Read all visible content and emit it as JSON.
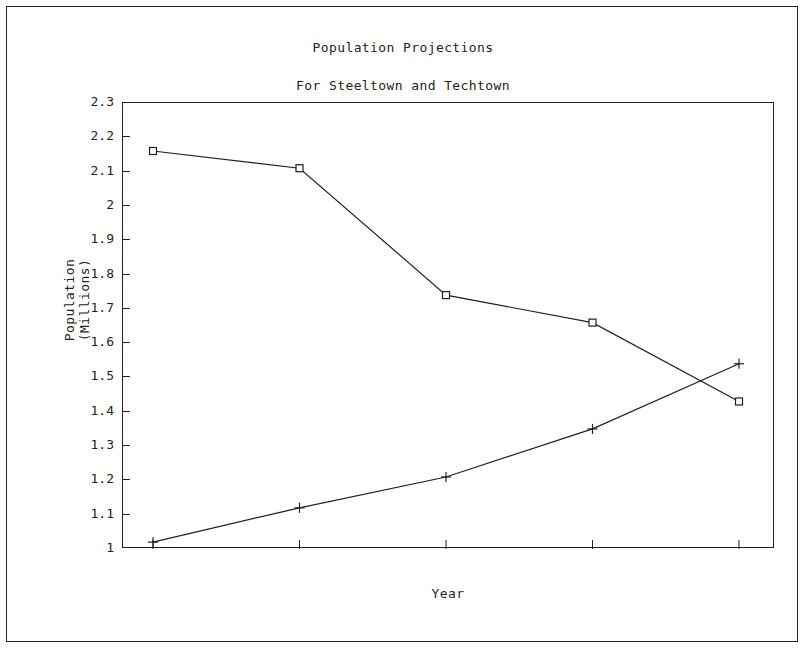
{
  "chart_data": {
    "type": "line",
    "title": "Population Projections",
    "subtitle": "For Steeltown and Techtown",
    "xlabel": "Year",
    "ylabel_line1": "Population",
    "ylabel_line2": "(Millions)",
    "ylim": [
      1,
      2.3
    ],
    "ytick_labels": [
      "2.3",
      "2.2",
      "2.1",
      "2",
      "1.9",
      "1.8",
      "1.7",
      "1.6",
      "1.5",
      "1.4",
      "1.3",
      "1.2",
      "1.1",
      "1"
    ],
    "ytick_values": [
      2.3,
      2.2,
      2.1,
      2.0,
      1.9,
      1.8,
      1.7,
      1.6,
      1.5,
      1.4,
      1.3,
      1.2,
      1.1,
      1.0
    ],
    "xtick_labels": [
      "",
      "",
      "",
      "",
      ""
    ],
    "x_positions": [
      0,
      1,
      2,
      3,
      4
    ],
    "grid": false,
    "legend": "none",
    "line_color": "#231f20",
    "series": [
      {
        "name": "Steeltown",
        "marker": "square",
        "values": [
          2.16,
          2.11,
          1.74,
          1.66,
          1.43
        ]
      },
      {
        "name": "Techtown",
        "marker": "plus",
        "values": [
          1.02,
          1.12,
          1.21,
          1.35,
          1.54
        ]
      }
    ]
  }
}
